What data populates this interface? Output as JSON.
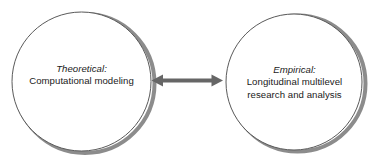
{
  "diagram": {
    "type": "two-node-bidirectional",
    "background_color": "#ffffff",
    "nodes": [
      {
        "id": "theoretical",
        "shape": "circle",
        "title": "Theoretical:",
        "lines": [
          "Computational modeling"
        ],
        "outline_color": "#5a5a5a",
        "shadow_color": "#8c8c8c",
        "fill_color": "#ffffff",
        "text_color": "#1a1a1a"
      },
      {
        "id": "empirical",
        "shape": "circle",
        "title": "Empirical:",
        "lines": [
          "Longitudinal multilevel",
          "research and analysis"
        ],
        "outline_color": "#5a5a5a",
        "shadow_color": "#8c8c8c",
        "fill_color": "#ffffff",
        "text_color": "#1a1a1a"
      }
    ],
    "connector": {
      "id": "bidirectional-arrow",
      "style": "double-headed",
      "color": "#666666"
    }
  }
}
